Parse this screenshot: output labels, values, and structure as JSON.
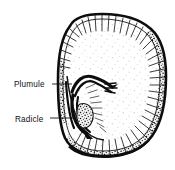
{
  "figure": {
    "type": "botanical-line-drawing",
    "background_color": "#ffffff",
    "ink_color": "#111111",
    "width": 175,
    "height": 170
  },
  "labels": [
    {
      "id": "plumule",
      "text": "Plumule",
      "text_x": 14,
      "text_y": 87,
      "leader_from_x": 52,
      "leader_from_y": 84,
      "leader_to_x": 72,
      "leader_to_y": 84
    },
    {
      "id": "radicle",
      "text": "Radicle",
      "text_x": 15,
      "text_y": 122,
      "leader_from_x": 50,
      "leader_from_y": 118,
      "leader_to_x": 73,
      "leader_to_y": 118
    }
  ],
  "parts": {
    "seed_coat": "seed-coat-outline",
    "endosperm": "endosperm-interior",
    "stipple_band": "granular-endosperm-band",
    "embryo": "embryo-structure",
    "plumule": "plumule-shoot",
    "radicle": "radicle-root"
  }
}
